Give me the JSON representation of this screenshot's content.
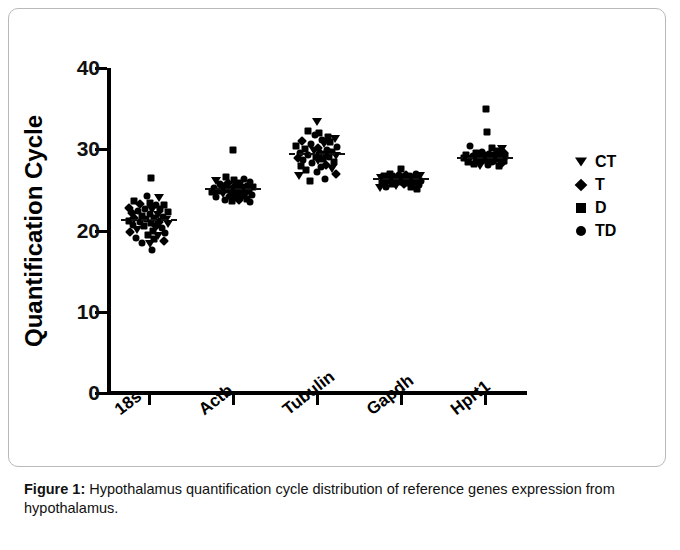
{
  "figure": {
    "caption_label": "Figure 1:",
    "caption_text": " Hypothalamus quantification cycle distribution of reference genes expression from hypothalamus."
  },
  "legend": {
    "entries": [
      {
        "label": "CT",
        "marker": "triangle-down-icon"
      },
      {
        "label": "T",
        "marker": "diamond-icon"
      },
      {
        "label": "D",
        "marker": "square-icon"
      },
      {
        "label": "TD",
        "marker": "circle-icon"
      }
    ]
  },
  "chart_data": {
    "type": "scatter",
    "title": "",
    "xlabel": "",
    "ylabel": "Quantification Cycle",
    "ylim": [
      0,
      40
    ],
    "yticks": [
      0,
      10,
      20,
      30,
      40
    ],
    "ytick_labels": [
      "0",
      "10",
      "20",
      "30",
      "40"
    ],
    "grid": false,
    "legend_position": "right",
    "categories": [
      "18s",
      "Actb",
      "Tubulin",
      "Gapdh",
      "Hprt1"
    ],
    "group_markers": {
      "CT": "triangle-down",
      "T": "diamond",
      "D": "square",
      "TD": "circle"
    },
    "means": [
      21.3,
      25.1,
      29.4,
      26.4,
      28.9
    ],
    "points": {
      "18s": [
        {
          "g": "D",
          "y": 26.5,
          "j": 0.06
        },
        {
          "g": "TD",
          "y": 24.3,
          "j": -0.06
        },
        {
          "g": "CT",
          "y": 24.0,
          "j": 0.3
        },
        {
          "g": "D",
          "y": 23.6,
          "j": -0.46
        },
        {
          "g": "D",
          "y": 23.4,
          "j": 0.02
        },
        {
          "g": "T",
          "y": 23.3,
          "j": -0.26
        },
        {
          "g": "TD",
          "y": 23.2,
          "j": 0.2
        },
        {
          "g": "D",
          "y": 23.1,
          "j": 0.46
        },
        {
          "g": "T",
          "y": 22.8,
          "j": -0.6
        },
        {
          "g": "TD",
          "y": 22.7,
          "j": -0.12
        },
        {
          "g": "D",
          "y": 22.6,
          "j": 0.34
        },
        {
          "g": "CT",
          "y": 22.5,
          "j": 0.1
        },
        {
          "g": "TD",
          "y": 22.4,
          "j": -0.34
        },
        {
          "g": "D",
          "y": 22.3,
          "j": 0.58
        },
        {
          "g": "T",
          "y": 22.2,
          "j": -0.52
        },
        {
          "g": "TD",
          "y": 22.0,
          "j": 0.04
        },
        {
          "g": "CT",
          "y": 21.9,
          "j": 0.26
        },
        {
          "g": "D",
          "y": 21.8,
          "j": -0.2
        },
        {
          "g": "TD",
          "y": 21.7,
          "j": 0.42
        },
        {
          "g": "T",
          "y": 21.6,
          "j": -0.44
        },
        {
          "g": "D",
          "y": 21.5,
          "j": 0.14
        },
        {
          "g": "TD",
          "y": 21.4,
          "j": -0.08
        },
        {
          "g": "CT",
          "y": 21.3,
          "j": 0.5
        },
        {
          "g": "D",
          "y": 21.2,
          "j": -0.6
        },
        {
          "g": "T",
          "y": 21.1,
          "j": 0.3
        },
        {
          "g": "TD",
          "y": 21.0,
          "j": -0.28
        },
        {
          "g": "D",
          "y": 20.9,
          "j": 0.06
        },
        {
          "g": "CT",
          "y": 20.8,
          "j": 0.56
        },
        {
          "g": "TD",
          "y": 20.7,
          "j": -0.48
        },
        {
          "g": "T",
          "y": 20.6,
          "j": 0.22
        },
        {
          "g": "D",
          "y": 20.5,
          "j": -0.14
        },
        {
          "g": "TD",
          "y": 20.3,
          "j": 0.38
        },
        {
          "g": "CT",
          "y": 20.1,
          "j": -0.36
        },
        {
          "g": "D",
          "y": 19.9,
          "j": 0.12
        },
        {
          "g": "T",
          "y": 19.8,
          "j": -0.58
        },
        {
          "g": "TD",
          "y": 19.7,
          "j": 0.48
        },
        {
          "g": "D",
          "y": 19.5,
          "j": -0.04
        },
        {
          "g": "CT",
          "y": 19.3,
          "j": 0.28
        },
        {
          "g": "TD",
          "y": 19.1,
          "j": -0.4
        },
        {
          "g": "D",
          "y": 18.9,
          "j": 0.16
        },
        {
          "g": "T",
          "y": 18.7,
          "j": 0.44
        },
        {
          "g": "TD",
          "y": 18.5,
          "j": -0.22
        },
        {
          "g": "CT",
          "y": 18.3,
          "j": 0.02
        },
        {
          "g": "TD",
          "y": 17.6,
          "j": 0.1
        }
      ],
      "Actb": [
        {
          "g": "D",
          "y": 29.9,
          "j": 0.0
        },
        {
          "g": "D",
          "y": 26.6,
          "j": -0.22
        },
        {
          "g": "TD",
          "y": 26.4,
          "j": 0.34
        },
        {
          "g": "D",
          "y": 26.2,
          "j": 0.02
        },
        {
          "g": "CT",
          "y": 26.1,
          "j": -0.52
        },
        {
          "g": "TD",
          "y": 26.0,
          "j": 0.52
        },
        {
          "g": "T",
          "y": 25.9,
          "j": -0.14
        },
        {
          "g": "D",
          "y": 25.8,
          "j": 0.22
        },
        {
          "g": "TD",
          "y": 25.7,
          "j": -0.4
        },
        {
          "g": "CT",
          "y": 25.6,
          "j": 0.1
        },
        {
          "g": "D",
          "y": 25.5,
          "j": 0.44
        },
        {
          "g": "TD",
          "y": 25.45,
          "j": -0.26
        },
        {
          "g": "T",
          "y": 25.4,
          "j": 0.04
        },
        {
          "g": "D",
          "y": 25.3,
          "j": 0.6
        },
        {
          "g": "TD",
          "y": 25.25,
          "j": -0.58
        },
        {
          "g": "CT",
          "y": 25.2,
          "j": 0.3
        },
        {
          "g": "D",
          "y": 25.15,
          "j": -0.06
        },
        {
          "g": "TD",
          "y": 25.1,
          "j": 0.16
        },
        {
          "g": "T",
          "y": 25.05,
          "j": -0.34
        },
        {
          "g": "D",
          "y": 25.0,
          "j": 0.48
        },
        {
          "g": "TD",
          "y": 24.95,
          "j": -0.18
        },
        {
          "g": "CT",
          "y": 24.9,
          "j": 0.08
        },
        {
          "g": "D",
          "y": 24.85,
          "j": -0.46
        },
        {
          "g": "TD",
          "y": 24.8,
          "j": 0.38
        },
        {
          "g": "T",
          "y": 24.75,
          "j": 0.0
        },
        {
          "g": "D",
          "y": 24.7,
          "j": -0.62
        },
        {
          "g": "TD",
          "y": 24.6,
          "j": 0.26
        },
        {
          "g": "CT",
          "y": 24.5,
          "j": -0.3
        },
        {
          "g": "D",
          "y": 24.45,
          "j": 0.14
        },
        {
          "g": "TD",
          "y": 24.4,
          "j": 0.56
        },
        {
          "g": "T",
          "y": 24.3,
          "j": -0.1
        },
        {
          "g": "D",
          "y": 24.2,
          "j": 0.32
        },
        {
          "g": "TD",
          "y": 24.1,
          "j": -0.5
        },
        {
          "g": "CT",
          "y": 24.0,
          "j": 0.06
        },
        {
          "g": "D",
          "y": 23.9,
          "j": 0.42
        },
        {
          "g": "TD",
          "y": 23.8,
          "j": -0.24
        },
        {
          "g": "T",
          "y": 23.7,
          "j": 0.18
        },
        {
          "g": "D",
          "y": 23.6,
          "j": -0.04
        },
        {
          "g": "TD",
          "y": 23.5,
          "j": 0.5
        }
      ],
      "Tubulin": [
        {
          "g": "CT",
          "y": 33.4,
          "j": 0.0
        },
        {
          "g": "D",
          "y": 32.2,
          "j": -0.28
        },
        {
          "g": "D",
          "y": 32.0,
          "j": 0.06
        },
        {
          "g": "TD",
          "y": 31.7,
          "j": -0.06
        },
        {
          "g": "D",
          "y": 31.5,
          "j": 0.34
        },
        {
          "g": "CT",
          "y": 31.3,
          "j": 0.54
        },
        {
          "g": "TD",
          "y": 31.2,
          "j": 0.14
        },
        {
          "g": "T",
          "y": 31.0,
          "j": -0.44
        },
        {
          "g": "D",
          "y": 30.9,
          "j": 0.4
        },
        {
          "g": "TD",
          "y": 30.7,
          "j": -0.18
        },
        {
          "g": "CT",
          "y": 30.6,
          "j": 0.22
        },
        {
          "g": "D",
          "y": 30.4,
          "j": -0.62
        },
        {
          "g": "TD",
          "y": 30.3,
          "j": 0.6
        },
        {
          "g": "T",
          "y": 30.2,
          "j": 0.02
        },
        {
          "g": "D",
          "y": 30.0,
          "j": -0.36
        },
        {
          "g": "TD",
          "y": 29.9,
          "j": 0.3
        },
        {
          "g": "CT",
          "y": 29.8,
          "j": -0.1
        },
        {
          "g": "D",
          "y": 29.7,
          "j": 0.46
        },
        {
          "g": "TD",
          "y": 29.6,
          "j": -0.52
        },
        {
          "g": "T",
          "y": 29.5,
          "j": 0.1
        },
        {
          "g": "D",
          "y": 29.4,
          "j": 0.26
        },
        {
          "g": "TD",
          "y": 29.3,
          "j": -0.26
        },
        {
          "g": "CT",
          "y": 29.2,
          "j": 0.56
        },
        {
          "g": "D",
          "y": 29.1,
          "j": -0.02
        },
        {
          "g": "TD",
          "y": 29.0,
          "j": 0.36
        },
        {
          "g": "T",
          "y": 28.9,
          "j": -0.58
        },
        {
          "g": "D",
          "y": 28.8,
          "j": 0.18
        },
        {
          "g": "TD",
          "y": 28.7,
          "j": -0.42
        },
        {
          "g": "CT",
          "y": 28.6,
          "j": 0.04
        },
        {
          "g": "D",
          "y": 28.4,
          "j": 0.5
        },
        {
          "g": "TD",
          "y": 28.3,
          "j": -0.14
        },
        {
          "g": "T",
          "y": 28.1,
          "j": 0.28
        },
        {
          "g": "D",
          "y": 28.0,
          "j": -0.48
        },
        {
          "g": "TD",
          "y": 27.8,
          "j": 0.12
        },
        {
          "g": "CT",
          "y": 27.6,
          "j": 0.44
        },
        {
          "g": "D",
          "y": 27.4,
          "j": -0.32
        },
        {
          "g": "TD",
          "y": 27.2,
          "j": 0.0
        },
        {
          "g": "T",
          "y": 27.0,
          "j": 0.58
        },
        {
          "g": "CT",
          "y": 26.7,
          "j": -0.54
        },
        {
          "g": "TD",
          "y": 26.4,
          "j": 0.24
        },
        {
          "g": "D",
          "y": 26.1,
          "j": -0.2
        }
      ],
      "Gapdh": [
        {
          "g": "D",
          "y": 27.6,
          "j": 0.0
        },
        {
          "g": "TD",
          "y": 27.0,
          "j": 0.44
        },
        {
          "g": "D",
          "y": 26.9,
          "j": -0.34
        },
        {
          "g": "T",
          "y": 26.85,
          "j": 0.16
        },
        {
          "g": "TD",
          "y": 26.8,
          "j": -0.06
        },
        {
          "g": "CT",
          "y": 26.75,
          "j": 0.56
        },
        {
          "g": "D",
          "y": 26.7,
          "j": -0.5
        },
        {
          "g": "TD",
          "y": 26.65,
          "j": 0.26
        },
        {
          "g": "D",
          "y": 26.6,
          "j": 0.04
        },
        {
          "g": "T",
          "y": 26.55,
          "j": -0.22
        },
        {
          "g": "TD",
          "y": 26.5,
          "j": 0.36
        },
        {
          "g": "CT",
          "y": 26.45,
          "j": -0.6
        },
        {
          "g": "D",
          "y": 26.4,
          "j": 0.12
        },
        {
          "g": "TD",
          "y": 26.38,
          "j": -0.4
        },
        {
          "g": "D",
          "y": 26.35,
          "j": 0.5
        },
        {
          "g": "T",
          "y": 26.3,
          "j": -0.12
        },
        {
          "g": "TD",
          "y": 26.25,
          "j": 0.22
        },
        {
          "g": "CT",
          "y": 26.2,
          "j": -0.3
        },
        {
          "g": "D",
          "y": 26.15,
          "j": 0.06
        },
        {
          "g": "TD",
          "y": 26.1,
          "j": 0.6
        },
        {
          "g": "D",
          "y": 26.05,
          "j": -0.46
        },
        {
          "g": "T",
          "y": 26.0,
          "j": 0.32
        },
        {
          "g": "TD",
          "y": 25.95,
          "j": -0.02
        },
        {
          "g": "CT",
          "y": 25.9,
          "j": 0.42
        },
        {
          "g": "D",
          "y": 25.85,
          "j": -0.56
        },
        {
          "g": "TD",
          "y": 25.8,
          "j": 0.18
        },
        {
          "g": "D",
          "y": 25.75,
          "j": -0.26
        },
        {
          "g": "T",
          "y": 25.7,
          "j": 0.08
        },
        {
          "g": "TD",
          "y": 25.6,
          "j": 0.54
        },
        {
          "g": "CT",
          "y": 25.5,
          "j": -0.16
        },
        {
          "g": "D",
          "y": 25.4,
          "j": 0.3
        },
        {
          "g": "TD",
          "y": 25.3,
          "j": -0.44
        },
        {
          "g": "CT",
          "y": 25.2,
          "j": -0.62
        },
        {
          "g": "D",
          "y": 25.1,
          "j": 0.48
        }
      ],
      "Hprt1": [
        {
          "g": "D",
          "y": 34.9,
          "j": 0.04
        },
        {
          "g": "D",
          "y": 32.1,
          "j": 0.06
        },
        {
          "g": "TD",
          "y": 30.4,
          "j": -0.44
        },
        {
          "g": "D",
          "y": 30.2,
          "j": 0.2
        },
        {
          "g": "CT",
          "y": 30.0,
          "j": 0.52
        },
        {
          "g": "D",
          "y": 29.8,
          "j": 0.36
        },
        {
          "g": "TD",
          "y": 29.7,
          "j": -0.08
        },
        {
          "g": "T",
          "y": 29.6,
          "j": 0.56
        },
        {
          "g": "D",
          "y": 29.5,
          "j": -0.28
        },
        {
          "g": "TD",
          "y": 29.45,
          "j": 0.12
        },
        {
          "g": "CT",
          "y": 29.4,
          "j": 0.44
        },
        {
          "g": "D",
          "y": 29.35,
          "j": -0.56
        },
        {
          "g": "TD",
          "y": 29.3,
          "j": 0.26
        },
        {
          "g": "T",
          "y": 29.25,
          "j": -0.02
        },
        {
          "g": "D",
          "y": 29.2,
          "j": 0.6
        },
        {
          "g": "TD",
          "y": 29.15,
          "j": -0.36
        },
        {
          "g": "CT",
          "y": 29.1,
          "j": 0.08
        },
        {
          "g": "D",
          "y": 29.05,
          "j": 0.34
        },
        {
          "g": "TD",
          "y": 29.0,
          "j": -0.18
        },
        {
          "g": "T",
          "y": 28.95,
          "j": 0.48
        },
        {
          "g": "D",
          "y": 28.9,
          "j": -0.62
        },
        {
          "g": "TD",
          "y": 28.85,
          "j": 0.16
        },
        {
          "g": "CT",
          "y": 28.8,
          "j": -0.46
        },
        {
          "g": "D",
          "y": 28.75,
          "j": 0.4
        },
        {
          "g": "TD",
          "y": 28.7,
          "j": 0.0
        },
        {
          "g": "T",
          "y": 28.65,
          "j": -0.24
        },
        {
          "g": "D",
          "y": 28.6,
          "j": 0.56
        },
        {
          "g": "TD",
          "y": 28.55,
          "j": -0.1
        },
        {
          "g": "CT",
          "y": 28.5,
          "j": 0.3
        },
        {
          "g": "D",
          "y": 28.45,
          "j": -0.52
        },
        {
          "g": "TD",
          "y": 28.4,
          "j": 0.22
        },
        {
          "g": "T",
          "y": 28.3,
          "j": 0.5
        },
        {
          "g": "D",
          "y": 28.2,
          "j": -0.32
        },
        {
          "g": "TD",
          "y": 28.1,
          "j": 0.1
        },
        {
          "g": "CT",
          "y": 28.0,
          "j": -0.14
        },
        {
          "g": "D",
          "y": 27.9,
          "j": 0.42
        }
      ]
    }
  }
}
